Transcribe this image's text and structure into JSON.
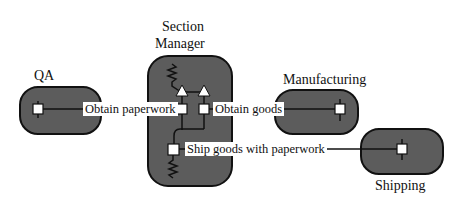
{
  "nodes": {
    "qa": {
      "label": "QA"
    },
    "section_manager": {
      "label_line1": "Section",
      "label_line2": "Manager"
    },
    "manufacturing": {
      "label": "Manufacturing"
    },
    "shipping": {
      "label": "Shipping"
    }
  },
  "connections": {
    "obtain_paperwork": "Obtain paperwork",
    "obtain_goods": "Obtain goods",
    "ship_goods": "Ship goods with paperwork"
  },
  "colors": {
    "node_fill": "#5a5a5a",
    "node_stroke": "#111111",
    "port_fill": "#ffffff"
  }
}
